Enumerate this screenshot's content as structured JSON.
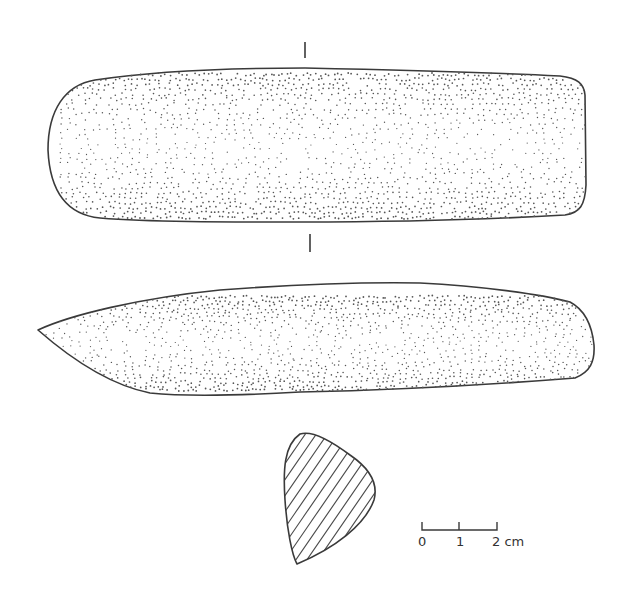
{
  "figure": {
    "views": [
      {
        "id": "face-view",
        "label": "dorsal/face view"
      },
      {
        "id": "side-view",
        "label": "lateral view"
      },
      {
        "id": "cross-section",
        "label": "cross-section (hatched)"
      }
    ],
    "section_markers": [
      "|",
      "|"
    ]
  },
  "scale_bar": {
    "labels": [
      "0",
      "1",
      "2 cm"
    ],
    "unit": "cm",
    "max": 2
  },
  "colors": {
    "line": "#3a3a3a",
    "stipple": "#555555",
    "background": "#ffffff"
  }
}
